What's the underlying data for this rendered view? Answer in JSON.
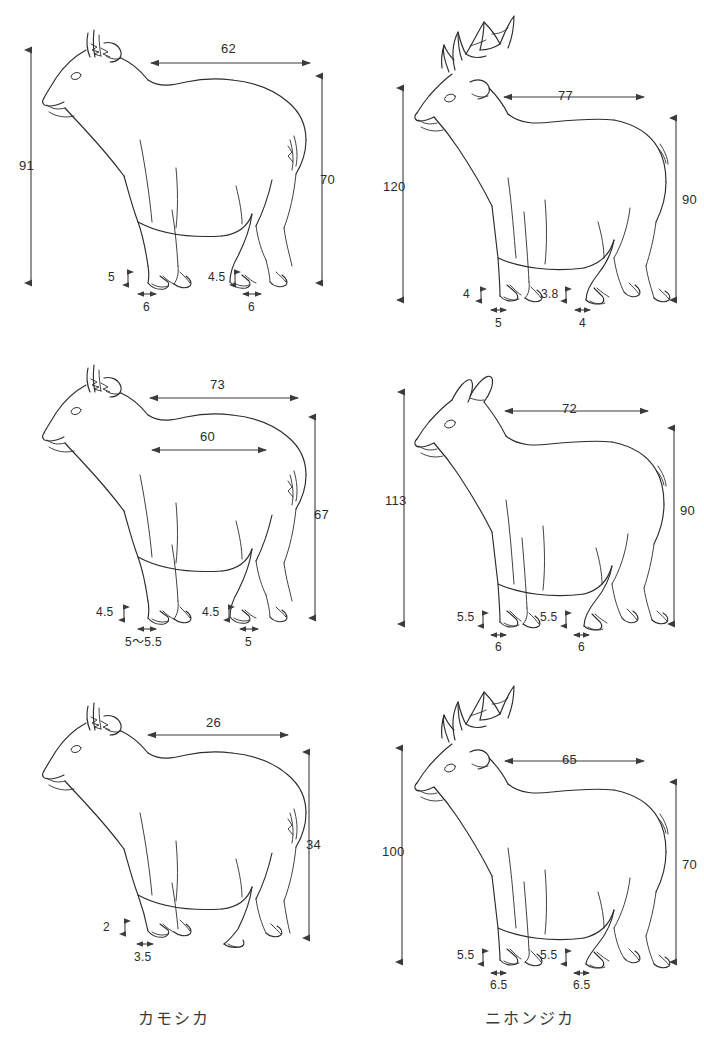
{
  "figure": {
    "title_left": "カモシカ",
    "title_right": "ニホンジカ",
    "ink_color": "#2c2c2c",
    "dim_color": "#3b3b3b",
    "background": "#ffffff"
  },
  "captions": {
    "left": "カモシカ",
    "right": "ニホンジカ"
  },
  "panels": [
    {
      "id": "serow-adult",
      "species": "カモシカ",
      "row": 1,
      "column": "left",
      "measurements": {
        "total_height": "91",
        "body_length": "62",
        "shoulder_height": "70",
        "front_hoof_height": "5",
        "front_hoof_width": "6",
        "hind_hoof_height": "4.5",
        "hind_hoof_width": "6"
      }
    },
    {
      "id": "deer-stag",
      "species": "ニホンジカ",
      "row": 1,
      "column": "right",
      "measurements": {
        "total_height": "120",
        "body_length": "77",
        "shoulder_height": "90",
        "front_hoof_height": "4",
        "front_hoof_width": "5",
        "hind_hoof_height": "3.8",
        "hind_hoof_width": "4"
      }
    },
    {
      "id": "serow-sub",
      "species": "カモシカ",
      "row": 2,
      "column": "left",
      "measurements": {
        "body_length_upper": "73",
        "body_length_lower": "60",
        "shoulder_height": "67",
        "front_hoof_height": "4.5",
        "front_hoof_width": "5～5.5",
        "hind_hoof_height": "4.5",
        "hind_hoof_width": "5"
      }
    },
    {
      "id": "deer-hind",
      "species": "ニホンジカ",
      "row": 2,
      "column": "right",
      "measurements": {
        "total_height": "113",
        "body_length": "72",
        "shoulder_height": "90",
        "front_hoof_height": "5.5",
        "front_hoof_width": "6",
        "hind_hoof_height": "5.5",
        "hind_hoof_width": "6"
      }
    },
    {
      "id": "serow-young",
      "species": "カモシカ",
      "row": 3,
      "column": "left",
      "measurements": {
        "body_length": "26",
        "shoulder_height": "34",
        "front_hoof_height": "2",
        "front_hoof_width": "3.5"
      }
    },
    {
      "id": "deer-stag-2",
      "species": "ニホンジカ",
      "row": 3,
      "column": "right",
      "measurements": {
        "total_height": "100",
        "body_length": "65",
        "shoulder_height": "70",
        "front_hoof_height": "5.5",
        "front_hoof_width": "6.5",
        "hind_hoof_height": "5.5",
        "hind_hoof_width": "6.5"
      }
    }
  ],
  "labels": {
    "p1_91": "91",
    "p1_62": "62",
    "p1_70": "70",
    "p1_h5": "5",
    "p1_w6a": "6",
    "p1_h45": "4.5",
    "p1_w6b": "6",
    "p2_120": "120",
    "p2_77": "77",
    "p2_90": "90",
    "p2_h4": "4",
    "p2_w5": "5",
    "p2_h38": "3.8",
    "p2_w4": "4",
    "p3_73": "73",
    "p3_60": "60",
    "p3_67": "67",
    "p3_h45a": "4.5",
    "p3_w55": "5～5.5",
    "p3_h45b": "4.5",
    "p3_w5": "5",
    "p4_113": "113",
    "p4_72": "72",
    "p4_90": "90",
    "p4_h55a": "5.5",
    "p4_w6a": "6",
    "p4_h55b": "5.5",
    "p4_w6b": "6",
    "p5_26": "26",
    "p5_34": "34",
    "p5_h2": "2",
    "p5_w35": "3.5",
    "p6_100": "100",
    "p6_65": "65",
    "p6_70": "70",
    "p6_h55a": "5.5",
    "p6_w65a": "6.5",
    "p6_h55b": "5.5",
    "p6_w65b": "6.5"
  }
}
